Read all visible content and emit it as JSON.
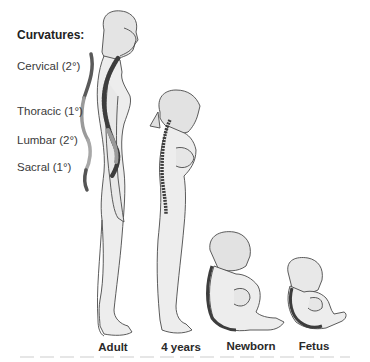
{
  "legend": {
    "title": "Curvatures:",
    "items": [
      {
        "label": "Cervical (2°)"
      },
      {
        "label": "Thoracic (1°)"
      },
      {
        "label": "Lumbar (2°)"
      },
      {
        "label": "Sacral (1°)"
      }
    ]
  },
  "figures": [
    {
      "caption": "Adult"
    },
    {
      "caption": "4 years"
    },
    {
      "caption": "Newborn"
    },
    {
      "caption": "Fetus"
    }
  ],
  "colors": {
    "primary_curve": "#555555",
    "secondary_curve": "#9a9a9a",
    "skin": "#ececec",
    "outline": "#4a4a4a",
    "spine": "#3d3d3d"
  }
}
